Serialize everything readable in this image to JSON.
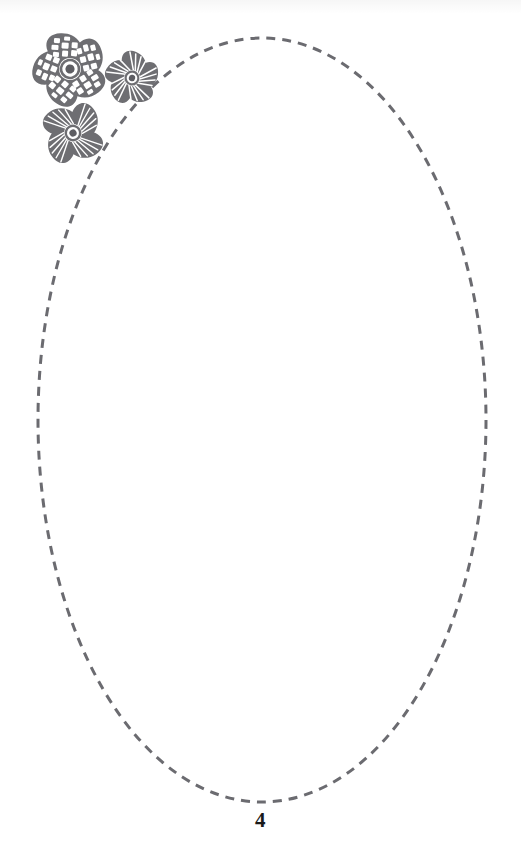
{
  "page": {
    "width": 521,
    "height": 862,
    "background_color": "#ffffff",
    "page_number": "4"
  },
  "shape": {
    "name": "dashed-ellipse",
    "type": "ellipse",
    "center_x": 262,
    "center_y": 420,
    "radius_x": 224,
    "radius_y": 382,
    "stroke_color": "#6b6b70",
    "stroke_width": 3,
    "dash_length": 9,
    "gap_length": 7,
    "fill": "none"
  },
  "decoration": {
    "name": "flower-cluster",
    "color": "#6e6e72",
    "flowers": [
      {
        "name": "flower-large",
        "petals": 5,
        "texture": "dashed-brick",
        "center_x": 70,
        "center_y": 69,
        "radius": 33
      },
      {
        "name": "flower-medium",
        "petals": 5,
        "texture": "radiating-lines",
        "center_x": 132,
        "center_y": 78,
        "radius": 23
      },
      {
        "name": "flower-lower",
        "petals": 4,
        "texture": "radiating-lines",
        "center_x": 73,
        "center_y": 133,
        "radius": 28
      }
    ]
  }
}
